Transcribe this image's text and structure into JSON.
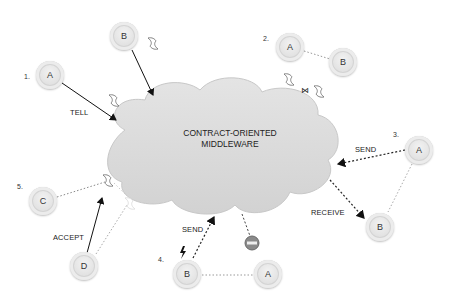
{
  "diagram": {
    "center": {
      "line1": "CONTRACT-ORIENTED",
      "line2": "MIDDLEWARE"
    },
    "scenarios": [
      {
        "number": "1.",
        "nodes": [
          "A"
        ],
        "edge_label": "TELL"
      },
      {
        "number": "2.",
        "nodes": [
          "A",
          "B"
        ]
      },
      {
        "number": "3.",
        "nodes": [
          "A",
          "B"
        ],
        "edge_labels": [
          "SEND",
          "RECEIVE"
        ]
      },
      {
        "number": "4.",
        "nodes": [
          "B",
          "A"
        ],
        "edge_label": "SEND"
      },
      {
        "number": "5.",
        "nodes": [
          "C",
          "D"
        ],
        "edge_label": "ACCEPT"
      }
    ],
    "top_node": "B",
    "colors": {
      "cloud": "#d9d9d9",
      "node": "#e3e3e3",
      "stop": "#8a8a8a",
      "text": "#222222"
    }
  }
}
